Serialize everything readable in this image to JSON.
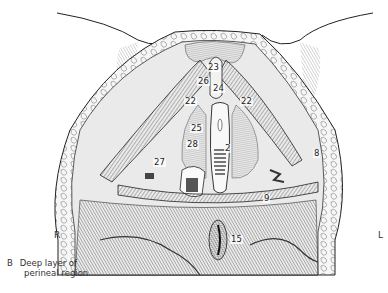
{
  "figure": {
    "panel_letter": "B",
    "caption_line1": "Deep layer of",
    "caption_line2": "perineal region",
    "side_left": "R",
    "side_right": "L"
  },
  "labels": [
    {
      "id": "23",
      "x": 207,
      "y": 63
    },
    {
      "id": "26",
      "x": 197,
      "y": 77
    },
    {
      "id": "24",
      "x": 214,
      "y": 84
    },
    {
      "id": "22",
      "x": 186,
      "y": 97
    },
    {
      "id": "22",
      "x": 246,
      "y": 97
    },
    {
      "id": "25",
      "x": 189,
      "y": 122
    },
    {
      "id": "28",
      "x": 187,
      "y": 137
    },
    {
      "id": "2",
      "x": 224,
      "y": 143
    },
    {
      "id": "27",
      "x": 153,
      "y": 156
    },
    {
      "id": "8",
      "x": 312,
      "y": 149
    },
    {
      "id": "9",
      "x": 262,
      "y": 194
    },
    {
      "id": "15",
      "x": 228,
      "y": 235
    }
  ],
  "colors": {
    "ink": "#222222",
    "shade": "#888888",
    "background": "#ffffff"
  }
}
